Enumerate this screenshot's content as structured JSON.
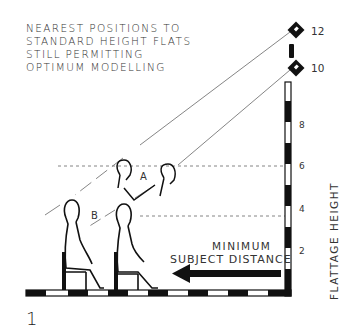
{
  "caption": {
    "lines": [
      "NEAREST POSITIONS TO",
      "STANDARD HEIGHT FLATS",
      "STILL PERMITTING",
      "OPTIMUM MODELLING"
    ]
  },
  "figure_number": "1",
  "flattage_axis": {
    "label": "FLATTAGE HEIGHT",
    "ticks": [
      "2",
      "4",
      "6",
      "8"
    ]
  },
  "lamps": [
    {
      "label": "12"
    },
    {
      "label": "10"
    }
  ],
  "zones": {
    "a": "A",
    "b": "B"
  },
  "distance_label": {
    "line1": "MINIMUM",
    "line2": "SUBJECT DISTANCE"
  },
  "colors": {
    "ink": "#1a1a1a",
    "paper": "#ffffff",
    "line": "#555555"
  }
}
